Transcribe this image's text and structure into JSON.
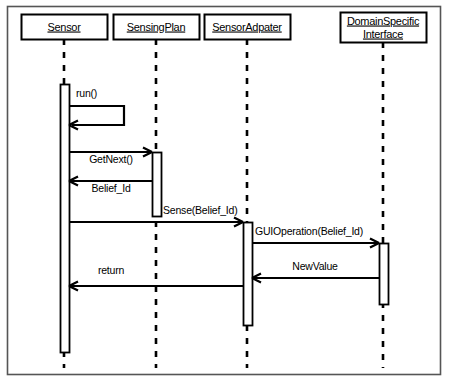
{
  "diagram": {
    "kind": "uml-sequence-diagram",
    "frame": {
      "stroke": "#555555",
      "fill": "#ffffff",
      "x": 7,
      "y": 6,
      "width": 434,
      "height": 369
    },
    "style": {
      "line_color": "#000000",
      "lifeline_color": "#000000",
      "activation_fill": "#ffffff",
      "box_fill": "#ffffff",
      "background": "#ffffff"
    },
    "participants": [
      {
        "id": "sensor",
        "label_lines": [
          "Sensor"
        ],
        "box": {
          "x": 21,
          "y": 14,
          "width": 86,
          "height": 25
        },
        "lifeline_x": 64,
        "lifeline_top": 39,
        "lifeline_bottom": 368
      },
      {
        "id": "sensingplan",
        "label_lines": [
          "SensingPlan"
        ],
        "box": {
          "x": 113,
          "y": 14,
          "width": 86,
          "height": 25
        },
        "lifeline_x": 156,
        "lifeline_top": 39,
        "lifeline_bottom": 368
      },
      {
        "id": "sensoradpater",
        "label_lines": [
          "SensorAdpater"
        ],
        "box": {
          "x": 204,
          "y": 14,
          "width": 86,
          "height": 25
        },
        "lifeline_x": 247,
        "lifeline_top": 39,
        "lifeline_bottom": 368
      },
      {
        "id": "domainspecificinterface",
        "label_lines": [
          "DomainSpecific",
          "Interface"
        ],
        "box": {
          "x": 340,
          "y": 12,
          "width": 86,
          "height": 30
        },
        "lifeline_x": 383,
        "lifeline_top": 42,
        "lifeline_bottom": 368
      }
    ],
    "activations": [
      {
        "id": "act-sensor",
        "participant": "sensor",
        "x": 60,
        "y": 84,
        "width": 9,
        "height": 268
      },
      {
        "id": "act-sensingplan",
        "participant": "sensingplan",
        "x": 152,
        "y": 152,
        "width": 9,
        "height": 64
      },
      {
        "id": "act-sensoradpater",
        "participant": "sensoradpater",
        "x": 243,
        "y": 222,
        "width": 9,
        "height": 103
      },
      {
        "id": "act-domain",
        "participant": "domainspecificinterface",
        "x": 379,
        "y": 243,
        "width": 9,
        "height": 61
      }
    ],
    "messages": [
      {
        "id": "msg-run",
        "label": "run()",
        "type": "self-call",
        "label_x": 76,
        "label_y": 97,
        "from": "sensor",
        "to": "sensor",
        "path": "M 69 106 L 124 106 L 124 125 L 72 125",
        "arrow_at": {
          "x": 69,
          "y": 125
        },
        "arrow_dir": "left"
      },
      {
        "id": "msg-getnext",
        "label": "GetNext()",
        "type": "call",
        "label_x": 111,
        "label_y": 163,
        "from": "sensor",
        "to": "sensingplan",
        "line": {
          "x1": 69,
          "y1": 152,
          "x2": 152,
          "y2": 152
        },
        "arrow_at": {
          "x": 152,
          "y": 152
        },
        "arrow_dir": "right"
      },
      {
        "id": "msg-beliefid",
        "label": "Belief_Id",
        "type": "return",
        "label_x": 111,
        "label_y": 192,
        "from": "sensingplan",
        "to": "sensor",
        "line": {
          "x1": 152,
          "y1": 181,
          "x2": 69,
          "y2": 181
        },
        "arrow_at": {
          "x": 69,
          "y": 181
        },
        "arrow_dir": "left"
      },
      {
        "id": "msg-sense",
        "label": "Sense(Belief_Id)",
        "type": "call",
        "label_x": 163,
        "label_y": 214,
        "from": "sensor",
        "to": "sensoradpater",
        "line": {
          "x1": 69,
          "y1": 222,
          "x2": 243,
          "y2": 222
        },
        "arrow_at": {
          "x": 243,
          "y": 222
        },
        "arrow_dir": "right"
      },
      {
        "id": "msg-guioperation",
        "label": "GUIOperation(Belief_Id)",
        "type": "call",
        "label_x": 255,
        "label_y": 235,
        "from": "sensoradpater",
        "to": "domainspecificinterface",
        "line": {
          "x1": 252,
          "y1": 243,
          "x2": 379,
          "y2": 243
        },
        "arrow_at": {
          "x": 379,
          "y": 243
        },
        "arrow_dir": "right"
      },
      {
        "id": "msg-newvalue",
        "label": "NewValue",
        "type": "return",
        "label_x": 315,
        "label_y": 270,
        "from": "domainspecificinterface",
        "to": "sensoradpater",
        "line": {
          "x1": 379,
          "y1": 278,
          "x2": 252,
          "y2": 278
        },
        "arrow_at": {
          "x": 252,
          "y": 278
        },
        "arrow_dir": "left"
      },
      {
        "id": "msg-return",
        "label": "return",
        "type": "return",
        "label_x": 111,
        "label_y": 274,
        "from": "sensoradpater",
        "to": "sensor",
        "line": {
          "x1": 243,
          "y1": 286,
          "x2": 69,
          "y2": 286
        },
        "arrow_at": {
          "x": 69,
          "y": 286
        },
        "arrow_dir": "left"
      }
    ]
  }
}
